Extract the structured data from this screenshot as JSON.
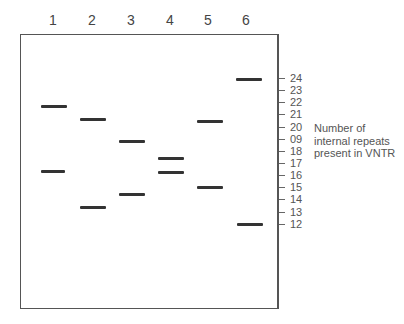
{
  "lanes": [
    {
      "label": "1",
      "x": 53
    },
    {
      "label": "2",
      "x": 92
    },
    {
      "label": "3",
      "x": 131
    },
    {
      "label": "4",
      "x": 170
    },
    {
      "label": "5",
      "x": 208
    },
    {
      "label": "6",
      "x": 246
    }
  ],
  "axis": {
    "title_line1": "Number of",
    "title_line2": "internal repeats",
    "title_line3": "present in VNTR",
    "ticks": [
      {
        "label": "24",
        "y": 78
      },
      {
        "label": "23",
        "y": 90
      },
      {
        "label": "22",
        "y": 102
      },
      {
        "label": "21",
        "y": 114
      },
      {
        "label": "20",
        "y": 127
      },
      {
        "label": "09",
        "y": 139
      },
      {
        "label": "18",
        "y": 151
      },
      {
        "label": "17",
        "y": 163
      },
      {
        "label": "16",
        "y": 175
      },
      {
        "label": "15",
        "y": 187
      },
      {
        "label": "14",
        "y": 199
      },
      {
        "label": "13",
        "y": 212
      },
      {
        "label": "12",
        "y": 224
      }
    ]
  },
  "bands": [
    {
      "lane": "1",
      "repeats": 22,
      "x": 41,
      "y": 105,
      "w": 26
    },
    {
      "lane": "1",
      "repeats": 16.5,
      "x": 41,
      "y": 170,
      "w": 24
    },
    {
      "lane": "2",
      "repeats": 21,
      "x": 80,
      "y": 118,
      "w": 26
    },
    {
      "lane": "2",
      "repeats": 13.5,
      "x": 80,
      "y": 206,
      "w": 26
    },
    {
      "lane": "3",
      "repeats": 19,
      "x": 119,
      "y": 140,
      "w": 26
    },
    {
      "lane": "3",
      "repeats": 14.5,
      "x": 119,
      "y": 193,
      "w": 26
    },
    {
      "lane": "4",
      "repeats": 17.5,
      "x": 158,
      "y": 157,
      "w": 26
    },
    {
      "lane": "4",
      "repeats": 16.5,
      "x": 158,
      "y": 171,
      "w": 26
    },
    {
      "lane": "5",
      "repeats": 21,
      "x": 197,
      "y": 120,
      "w": 26
    },
    {
      "lane": "5",
      "repeats": 15,
      "x": 197,
      "y": 186,
      "w": 26
    },
    {
      "lane": "6",
      "repeats": 24,
      "x": 236,
      "y": 78,
      "w": 26
    },
    {
      "lane": "6",
      "repeats": 12,
      "x": 237,
      "y": 223,
      "w": 26
    }
  ]
}
